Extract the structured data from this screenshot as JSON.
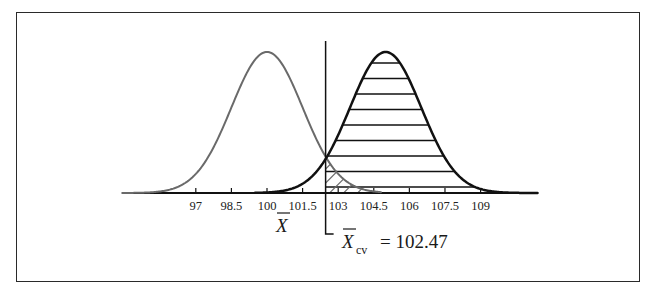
{
  "chart_data": {
    "type": "line",
    "title": "",
    "xlabel": "X̄",
    "ylabel": "",
    "x_ticks": [
      97,
      98.5,
      100,
      101.5,
      103,
      104.5,
      106,
      107.5,
      109
    ],
    "xlim": [
      93.9,
      111.4
    ],
    "grid": false,
    "legend": "none",
    "series": [
      {
        "name": "null distribution (H0)",
        "mean": 100,
        "sd": 1.5,
        "color": "#6a6a6a",
        "line_width": 2
      },
      {
        "name": "alternative distribution (H1)",
        "mean": 105,
        "sd": 1.5,
        "color": "#111111",
        "line_width": 2.5
      }
    ],
    "critical_value": {
      "value": 102.47,
      "label_symbol": "X̄",
      "label_subscript": "cv",
      "label_equals": "=",
      "label_value": "102.47"
    },
    "shaded_regions": [
      {
        "name": "power region",
        "under": "alternative distribution (H1)",
        "from": 102.47,
        "pattern": "horizontal-lines"
      },
      {
        "name": "alpha region",
        "under": "null distribution (H0)",
        "from": 102.47,
        "pattern": "diagonal-lines"
      }
    ]
  },
  "labels": {
    "xbar_symbol": "X",
    "cv_subscript": "cv",
    "cv_text": "= 102.47"
  }
}
